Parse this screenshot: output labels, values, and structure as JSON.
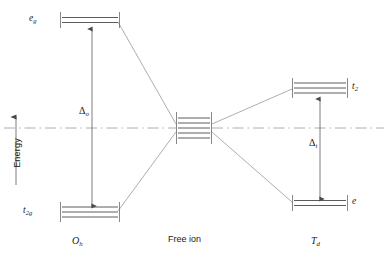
{
  "figure": {
    "type": "crystal-field-splitting-diagram",
    "axis": {
      "label": "Energy",
      "direction": "up",
      "arrow_icon": "up-arrow-icon"
    },
    "baseline": {
      "style": "dash-dot",
      "y": 128
    },
    "groups": [
      {
        "id": "oh",
        "name": "O",
        "name_sub": "h",
        "name_full": "Oh",
        "x_center": 92,
        "label_x": 72,
        "label_y": 240,
        "splitting": {
          "symbol": "Δ",
          "sub": "o",
          "label_x": 79,
          "label_y": 110
        },
        "levels": [
          {
            "term": "e",
            "term_sub": "g",
            "degeneracy": 2,
            "y": 20,
            "label_side": "left",
            "label_x": 29,
            "label_y": 16
          },
          {
            "term": "t",
            "term_sub": "2g",
            "degeneracy": 3,
            "y": 212,
            "label_side": "left",
            "label_x": 25,
            "label_y": 208
          }
        ]
      },
      {
        "id": "td",
        "name": "T",
        "name_sub": "d",
        "name_full": "Td",
        "x_center": 318,
        "label_x": 310,
        "label_y": 240,
        "splitting": {
          "symbol": "Δ",
          "sub": "t",
          "label_x": 309,
          "label_y": 142
        },
        "levels": [
          {
            "term": "t",
            "term_sub": "2",
            "degeneracy": 3,
            "y": 88,
            "label_side": "right",
            "label_x": 352,
            "label_y": 84
          },
          {
            "term": "e",
            "term_sub": "",
            "degeneracy": 2,
            "y": 203,
            "label_side": "right",
            "label_x": 352,
            "label_y": 199
          }
        ]
      }
    ],
    "center": {
      "id": "free-ion",
      "label": "Free ion",
      "label_x": 168,
      "label_y": 238,
      "degeneracy": 5,
      "y": 128,
      "x_center": 194
    },
    "colors": {
      "line": "#5a5a5a",
      "text": "#1a1a1a",
      "background": "#ffffff"
    }
  }
}
